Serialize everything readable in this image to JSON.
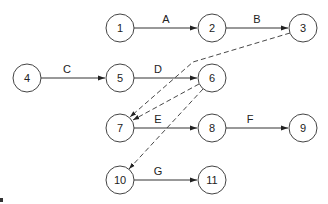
{
  "diagram": {
    "type": "activity-on-arrow network",
    "nodes": [
      {
        "id": "1",
        "label": "1",
        "x": 120,
        "y": 28
      },
      {
        "id": "2",
        "label": "2",
        "x": 212,
        "y": 28
      },
      {
        "id": "3",
        "label": "3",
        "x": 303,
        "y": 28
      },
      {
        "id": "4",
        "label": "4",
        "x": 27,
        "y": 78
      },
      {
        "id": "5",
        "label": "5",
        "x": 120,
        "y": 78
      },
      {
        "id": "6",
        "label": "6",
        "x": 212,
        "y": 78
      },
      {
        "id": "7",
        "label": "7",
        "x": 120,
        "y": 128
      },
      {
        "id": "8",
        "label": "8",
        "x": 212,
        "y": 128
      },
      {
        "id": "9",
        "label": "9",
        "x": 303,
        "y": 128
      },
      {
        "id": "10",
        "label": "10",
        "x": 120,
        "y": 180
      },
      {
        "id": "11",
        "label": "11",
        "x": 212,
        "y": 180
      }
    ],
    "activities": [
      {
        "label": "A",
        "from": "1",
        "to": "2",
        "style": "solid"
      },
      {
        "label": "B",
        "from": "2",
        "to": "3",
        "style": "solid"
      },
      {
        "label": "C",
        "from": "4",
        "to": "5",
        "style": "solid"
      },
      {
        "label": "D",
        "from": "5",
        "to": "6",
        "style": "solid"
      },
      {
        "label": "E",
        "from": "7",
        "to": "8",
        "style": "solid"
      },
      {
        "label": "F",
        "from": "8",
        "to": "9",
        "style": "solid"
      },
      {
        "label": "G",
        "from": "10",
        "to": "11",
        "style": "solid"
      }
    ],
    "dummies": [
      {
        "from": "3",
        "to": "7",
        "style": "dashed"
      },
      {
        "from": "6",
        "to": "7",
        "style": "dashed"
      },
      {
        "from": "6",
        "to": "10",
        "style": "dashed"
      }
    ],
    "colors": {
      "stroke": "#333333",
      "node_fill": "#ffffff",
      "text": "#222222"
    }
  }
}
